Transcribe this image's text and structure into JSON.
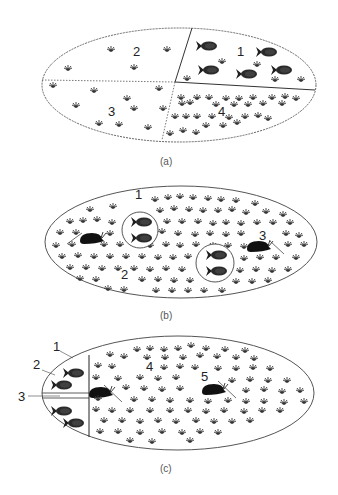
{
  "colors": {
    "ink": "#1e1e1e",
    "outline": "#555555",
    "plant": "#333333",
    "fish_fill": "#2a2a2a",
    "background": "#ffffff"
  },
  "panels": [
    {
      "id": "a",
      "caption": "(a)",
      "labels": [
        {
          "text": "2",
          "x": 133,
          "y": 56
        },
        {
          "text": "1",
          "x": 237,
          "y": 56
        },
        {
          "text": "3",
          "x": 108,
          "y": 116
        },
        {
          "text": "4",
          "x": 218,
          "y": 116
        }
      ],
      "regions": [
        "region 1: fish only",
        "region 2: sparse plants",
        "region 3: sparse plants",
        "region 4: dense plants"
      ]
    },
    {
      "id": "b",
      "caption": "(b)",
      "labels": [
        {
          "text": "1",
          "x": 135,
          "y": 199
        },
        {
          "text": "2",
          "x": 121,
          "y": 279
        },
        {
          "text": "3",
          "x": 259,
          "y": 240
        }
      ]
    },
    {
      "id": "c",
      "caption": "(c)",
      "labels": [
        {
          "text": "1",
          "x": 53,
          "y": 351
        },
        {
          "text": "2",
          "x": 33,
          "y": 369
        },
        {
          "text": "3",
          "x": 18,
          "y": 401
        },
        {
          "text": "4",
          "x": 146,
          "y": 371
        },
        {
          "text": "5",
          "x": 201,
          "y": 381
        }
      ]
    }
  ]
}
